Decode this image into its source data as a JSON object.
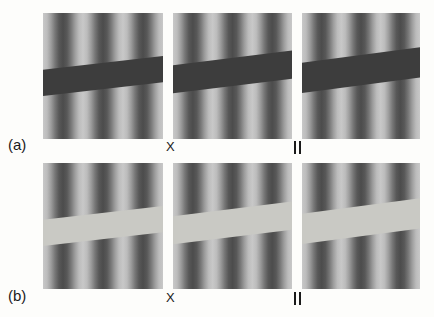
{
  "figure": {
    "background_color": "#fdfdfb",
    "rows": [
      {
        "tag": "(a)",
        "tag_x": 8,
        "tag_y": 137,
        "bar_kind": "dark",
        "bar_color": "#3d3d3d",
        "panel_top": 13,
        "panel_height": 126,
        "caption_y": 140,
        "panels": [
          {
            "name": "panel-a-1",
            "label": "",
            "label_symbol": "none",
            "x": 43,
            "width": 120,
            "bar_angle_deg": -6.5,
            "bar_thickness": 26,
            "bar_center_pct": 50
          },
          {
            "name": "panel-a-2",
            "label": "X",
            "label_symbol": "cross",
            "x": 173,
            "width": 119,
            "bar_angle_deg": -7.0,
            "bar_thickness": 28,
            "bar_center_pct": 47
          },
          {
            "name": "panel-a-3",
            "label": "∥",
            "label_symbol": "parallel",
            "x": 302,
            "width": 118,
            "bar_angle_deg": -7.5,
            "bar_thickness": 30,
            "bar_center_pct": 45
          }
        ]
      },
      {
        "tag": "(b)",
        "tag_x": 8,
        "tag_y": 288,
        "bar_kind": "light",
        "bar_color": "#c9c9c4",
        "panel_top": 163,
        "panel_height": 126,
        "caption_y": 291,
        "panels": [
          {
            "name": "panel-b-1",
            "label": "",
            "label_symbol": "none",
            "x": 43,
            "width": 120,
            "bar_angle_deg": -6.5,
            "bar_thickness": 26,
            "bar_center_pct": 50
          },
          {
            "name": "panel-b-2",
            "label": "X",
            "label_symbol": "cross",
            "x": 173,
            "width": 119,
            "bar_angle_deg": -7.0,
            "bar_thickness": 28,
            "bar_center_pct": 48
          },
          {
            "name": "panel-b-3",
            "label": "∥",
            "label_symbol": "parallel",
            "x": 302,
            "width": 118,
            "bar_angle_deg": -7.5,
            "bar_thickness": 30,
            "bar_center_pct": 46
          }
        ]
      }
    ],
    "grating": {
      "type": "vertical-sinusoid",
      "cycles_across_panel": 3,
      "light_color": "#e2e2e0",
      "dark_color": "#4a4a4a",
      "mid_color": "#8d8d8d"
    },
    "captions": {
      "column2_label": "X",
      "column3_label": "∥",
      "column2_label_x": 167,
      "column3_label_x": 293
    }
  }
}
